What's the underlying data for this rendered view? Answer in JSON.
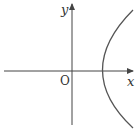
{
  "diagram": {
    "type": "parabola-graph",
    "equation_shape": "parabola opening right, vertex at origin",
    "axes": {
      "x_label": "x",
      "y_label": "y",
      "origin_label": "O"
    },
    "colors": {
      "axis": "#444444",
      "curve": "#555555",
      "text": "#333333",
      "background": "#ffffff"
    }
  }
}
